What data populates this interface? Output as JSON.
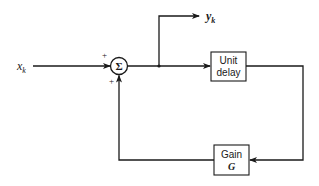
{
  "diagram": {
    "type": "block-diagram",
    "input": {
      "label_main": "x",
      "label_sub": "k"
    },
    "output": {
      "label_main": "y",
      "label_sub": "k"
    },
    "summer": {
      "symbol": "Σ",
      "sign_top": "+",
      "sign_bottom": "+"
    },
    "blocks": [
      {
        "id": "unit-delay",
        "line1": "Unit",
        "line2": "delay"
      },
      {
        "id": "gain",
        "line1": "Gain",
        "line2": "G"
      }
    ],
    "colors": {
      "stroke": "#1a1a1a",
      "background": "#ffffff"
    }
  }
}
